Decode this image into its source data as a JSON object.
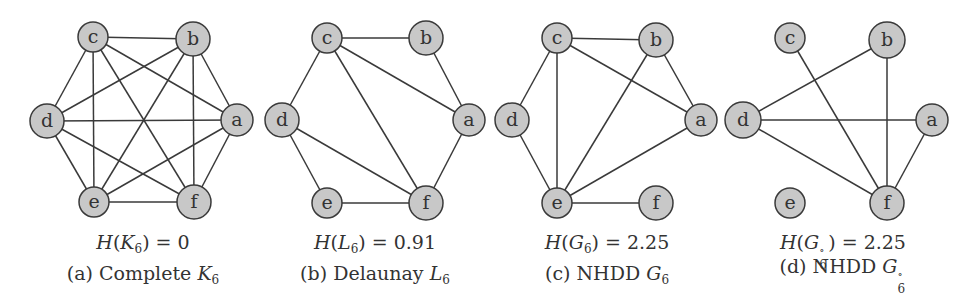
{
  "figure": {
    "node_style": {
      "fill": "#c8c8c8",
      "stroke": "#3a3a3a",
      "label_color": "#333333"
    },
    "edge_color": "#3a3a3a",
    "panels": [
      {
        "id": "a",
        "equation": {
          "func": "H",
          "graph": "K",
          "sub": "6",
          "sup": "",
          "value": "0"
        },
        "caption": {
          "tag": "(a)",
          "text": "Complete",
          "graph": "K",
          "sub": "6",
          "sup": ""
        },
        "nodes": [
          {
            "id": "a",
            "x": 237,
            "y": 120,
            "r": 16
          },
          {
            "id": "b",
            "x": 193,
            "y": 39,
            "r": 17
          },
          {
            "id": "c",
            "x": 93,
            "y": 37,
            "r": 15
          },
          {
            "id": "d",
            "x": 47,
            "y": 121,
            "r": 17
          },
          {
            "id": "e",
            "x": 94,
            "y": 202,
            "r": 15
          },
          {
            "id": "f",
            "x": 194,
            "y": 202,
            "r": 17
          }
        ],
        "edges": [
          [
            "a",
            "b"
          ],
          [
            "a",
            "c"
          ],
          [
            "a",
            "d"
          ],
          [
            "a",
            "e"
          ],
          [
            "a",
            "f"
          ],
          [
            "b",
            "c"
          ],
          [
            "b",
            "d"
          ],
          [
            "b",
            "e"
          ],
          [
            "b",
            "f"
          ],
          [
            "c",
            "d"
          ],
          [
            "c",
            "e"
          ],
          [
            "c",
            "f"
          ],
          [
            "d",
            "e"
          ],
          [
            "d",
            "f"
          ],
          [
            "e",
            "f"
          ]
        ]
      },
      {
        "id": "b",
        "equation": {
          "func": "H",
          "graph": "L",
          "sub": "6",
          "sup": "",
          "value": "0.91"
        },
        "caption": {
          "tag": "(b)",
          "text": "Delaunay",
          "graph": "L",
          "sub": "6",
          "sup": ""
        },
        "nodes": [
          {
            "id": "a",
            "x": 469,
            "y": 120,
            "r": 16
          },
          {
            "id": "b",
            "x": 426,
            "y": 38,
            "r": 17
          },
          {
            "id": "c",
            "x": 327,
            "y": 38,
            "r": 15
          },
          {
            "id": "d",
            "x": 282,
            "y": 120,
            "r": 17
          },
          {
            "id": "e",
            "x": 327,
            "y": 203,
            "r": 15
          },
          {
            "id": "f",
            "x": 426,
            "y": 203,
            "r": 17
          }
        ],
        "edges": [
          [
            "c",
            "b"
          ],
          [
            "b",
            "a"
          ],
          [
            "c",
            "a"
          ],
          [
            "c",
            "d"
          ],
          [
            "c",
            "f"
          ],
          [
            "a",
            "f"
          ],
          [
            "d",
            "f"
          ],
          [
            "d",
            "e"
          ],
          [
            "e",
            "f"
          ]
        ]
      },
      {
        "id": "c",
        "equation": {
          "func": "H",
          "graph": "G",
          "sub": "6",
          "sup": "",
          "value": "2.25"
        },
        "caption": {
          "tag": "(c)",
          "text": "NHDD",
          "graph": "G",
          "sub": "6",
          "sup": ""
        },
        "nodes": [
          {
            "id": "a",
            "x": 701,
            "y": 120,
            "r": 16
          },
          {
            "id": "b",
            "x": 656,
            "y": 40,
            "r": 17
          },
          {
            "id": "c",
            "x": 557,
            "y": 38,
            "r": 15
          },
          {
            "id": "d",
            "x": 512,
            "y": 120,
            "r": 17
          },
          {
            "id": "e",
            "x": 557,
            "y": 203,
            "r": 15
          },
          {
            "id": "f",
            "x": 656,
            "y": 203,
            "r": 17
          }
        ],
        "edges": [
          [
            "c",
            "b"
          ],
          [
            "b",
            "a"
          ],
          [
            "c",
            "a"
          ],
          [
            "c",
            "d"
          ],
          [
            "c",
            "e"
          ],
          [
            "b",
            "e"
          ],
          [
            "a",
            "e"
          ],
          [
            "d",
            "e"
          ],
          [
            "e",
            "f"
          ]
        ]
      },
      {
        "id": "d",
        "equation": {
          "func": "H",
          "graph": "G",
          "sub": "6",
          "sup": "∘",
          "value": "2.25"
        },
        "caption": {
          "tag": "(d)",
          "text": "NHDD",
          "graph": "G",
          "sub": "6",
          "sup": "∘"
        },
        "nodes": [
          {
            "id": "a",
            "x": 932,
            "y": 120,
            "r": 16
          },
          {
            "id": "b",
            "x": 887,
            "y": 40,
            "r": 18
          },
          {
            "id": "c",
            "x": 790,
            "y": 38,
            "r": 15
          },
          {
            "id": "d",
            "x": 743,
            "y": 120,
            "r": 18
          },
          {
            "id": "e",
            "x": 790,
            "y": 203,
            "r": 15
          },
          {
            "id": "f",
            "x": 887,
            "y": 203,
            "r": 17
          }
        ],
        "edges": [
          [
            "d",
            "b"
          ],
          [
            "d",
            "a"
          ],
          [
            "d",
            "f"
          ],
          [
            "c",
            "f"
          ],
          [
            "b",
            "f"
          ],
          [
            "a",
            "f"
          ]
        ]
      }
    ]
  }
}
